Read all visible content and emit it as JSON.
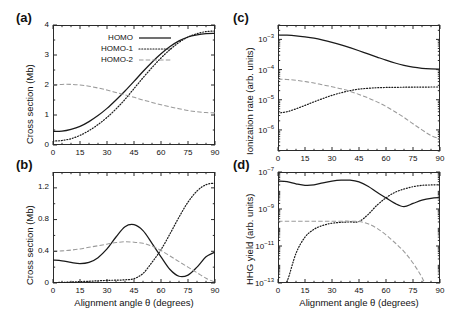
{
  "figure": {
    "shared_xlabel": "Alignment angle θ (degrees)",
    "legend": [
      {
        "label": "HOMO",
        "style": "solid",
        "color": "#1a1a1a"
      },
      {
        "label": "HOMO-1",
        "style": "dotted",
        "color": "#1a1a1a"
      },
      {
        "label": "HOMO-2",
        "style": "dashed",
        "color": "#9a9a9a"
      }
    ],
    "panels": [
      {
        "tag": "(a)"
      },
      {
        "tag": "(b)"
      },
      {
        "tag": "(c)"
      },
      {
        "tag": "(d)"
      }
    ]
  },
  "chart_data": [
    {
      "type": "line",
      "panel": "(a)",
      "title": "",
      "xlabel": "Alignment angle θ (degrees)",
      "ylabel": "Cross section (Mb)",
      "xlim": [
        0,
        90
      ],
      "ylim": [
        0,
        4
      ],
      "xticks": [
        0,
        15,
        30,
        45,
        60,
        75,
        90
      ],
      "yticks": [
        0,
        1,
        2,
        3,
        4
      ],
      "yscale": "linear",
      "grid": false,
      "legend_position": "upper-left-inside",
      "x": [
        0,
        5,
        10,
        15,
        20,
        25,
        30,
        35,
        40,
        45,
        50,
        55,
        60,
        65,
        70,
        75,
        80,
        85,
        90
      ],
      "series": [
        {
          "name": "HOMO",
          "style": "solid",
          "color": "#1a1a1a",
          "values": [
            0.45,
            0.46,
            0.52,
            0.62,
            0.78,
            0.98,
            1.22,
            1.5,
            1.8,
            2.12,
            2.45,
            2.76,
            3.04,
            3.28,
            3.47,
            3.6,
            3.67,
            3.71,
            3.72
          ]
        },
        {
          "name": "HOMO-1",
          "style": "dotted",
          "color": "#1a1a1a",
          "values": [
            0.13,
            0.15,
            0.21,
            0.32,
            0.48,
            0.68,
            0.92,
            1.2,
            1.52,
            1.88,
            2.24,
            2.58,
            2.9,
            3.18,
            3.42,
            3.6,
            3.71,
            3.78,
            3.8
          ]
        },
        {
          "name": "HOMO-2",
          "style": "dashed",
          "color": "#9a9a9a",
          "values": [
            2.0,
            2.02,
            2.02,
            2.0,
            1.96,
            1.9,
            1.83,
            1.75,
            1.67,
            1.59,
            1.5,
            1.42,
            1.34,
            1.27,
            1.21,
            1.15,
            1.11,
            1.08,
            1.07
          ]
        }
      ]
    },
    {
      "type": "line",
      "panel": "(b)",
      "title": "",
      "xlabel": "Alignment angle θ (degrees)",
      "ylabel": "Cross section (Mb)",
      "xlim": [
        0,
        90
      ],
      "ylim": [
        0,
        1.4
      ],
      "xticks": [
        0,
        15,
        30,
        45,
        60,
        75,
        90
      ],
      "yticks": [
        0,
        0.4,
        0.8,
        1.2
      ],
      "yscale": "linear",
      "grid": false,
      "x": [
        0,
        5,
        10,
        15,
        20,
        25,
        30,
        35,
        40,
        45,
        50,
        55,
        60,
        65,
        70,
        75,
        80,
        85,
        90
      ],
      "series": [
        {
          "name": "HOMO",
          "style": "solid",
          "color": "#1a1a1a",
          "values": [
            0.29,
            0.28,
            0.26,
            0.245,
            0.26,
            0.32,
            0.43,
            0.58,
            0.71,
            0.735,
            0.66,
            0.5,
            0.33,
            0.17,
            0.085,
            0.1,
            0.2,
            0.33,
            0.39
          ]
        },
        {
          "name": "HOMO-1",
          "style": "dotted",
          "color": "#1a1a1a",
          "values": [
            0.005,
            0.008,
            0.012,
            0.018,
            0.022,
            0.028,
            0.033,
            0.036,
            0.04,
            0.055,
            0.12,
            0.26,
            0.42,
            0.62,
            0.83,
            1.02,
            1.16,
            1.24,
            1.26
          ]
        },
        {
          "name": "HOMO-2",
          "style": "dashed",
          "color": "#9a9a9a",
          "values": [
            0.4,
            0.405,
            0.415,
            0.43,
            0.45,
            0.47,
            0.49,
            0.51,
            0.52,
            0.515,
            0.5,
            0.465,
            0.41,
            0.34,
            0.27,
            0.2,
            0.13,
            0.06,
            0.01
          ]
        }
      ]
    },
    {
      "type": "line",
      "panel": "(c)",
      "title": "",
      "xlabel": "Alignment angle θ (degrees)",
      "ylabel": "Ionization rate (arb. units)",
      "xlim": [
        0,
        90
      ],
      "ylim": [
        2e-07,
        0.003
      ],
      "xticks": [
        0,
        15,
        30,
        45,
        60,
        75,
        90
      ],
      "yticks": [
        0.001,
        0.0001,
        1e-05,
        1e-06
      ],
      "ytick_labels": [
        "10^-3",
        "10^-4",
        "10^-5",
        "10^-6"
      ],
      "yscale": "log",
      "grid": false,
      "x": [
        0,
        5,
        10,
        15,
        20,
        25,
        30,
        35,
        40,
        45,
        50,
        55,
        60,
        65,
        70,
        75,
        80,
        85,
        90
      ],
      "series": [
        {
          "name": "HOMO",
          "style": "solid",
          "color": "#1a1a1a",
          "values": [
            0.0014,
            0.00138,
            0.00132,
            0.00122,
            0.0011,
            0.00095,
            0.0008,
            0.00066,
            0.00053,
            0.00042,
            0.00033,
            0.00026,
            0.000205,
            0.000165,
            0.000138,
            0.00012,
            0.00011,
            0.000105,
            0.000103
          ]
        },
        {
          "name": "HOMO-1",
          "style": "dotted",
          "color": "#1a1a1a",
          "values": [
            3.6e-06,
            4e-06,
            5e-06,
            6.5e-06,
            8.5e-06,
            1.1e-05,
            1.4e-05,
            1.7e-05,
            2e-05,
            2.25e-05,
            2.4e-05,
            2.5e-05,
            2.55e-05,
            2.58e-05,
            2.6e-05,
            2.62e-05,
            2.63e-05,
            2.64e-05,
            2.65e-05
          ]
        },
        {
          "name": "HOMO-2",
          "style": "dashed",
          "color": "#9a9a9a",
          "values": [
            4.8e-05,
            4.7e-05,
            4.4e-05,
            4e-05,
            3.6e-05,
            3.1e-05,
            2.7e-05,
            2.3e-05,
            1.9e-05,
            1.5e-05,
            1.15e-05,
            8.5e-06,
            6e-06,
            4e-06,
            2.6e-06,
            1.6e-06,
            1e-06,
            6.5e-07,
            5e-07
          ]
        }
      ]
    },
    {
      "type": "line",
      "panel": "(d)",
      "title": "",
      "xlabel": "Alignment angle θ (degrees)",
      "ylabel": "HHG yield (arb. units)",
      "xlim": [
        0,
        90
      ],
      "ylim": [
        1e-13,
        1e-07
      ],
      "xticks": [
        0,
        15,
        30,
        45,
        60,
        75,
        90
      ],
      "yticks": [
        1e-07,
        1e-09,
        1e-11,
        1e-13
      ],
      "ytick_labels": [
        "10^-7",
        "10^-9",
        "10^-11",
        "10^-13"
      ],
      "yscale": "log",
      "grid": false,
      "x": [
        0,
        5,
        10,
        15,
        20,
        25,
        30,
        35,
        40,
        45,
        50,
        55,
        60,
        65,
        70,
        75,
        80,
        85,
        90
      ],
      "series": [
        {
          "name": "HOMO",
          "style": "solid",
          "color": "#1a1a1a",
          "values": [
            3.2e-08,
            3e-08,
            2.3e-08,
            1.9e-08,
            2e-08,
            2.6e-08,
            3.2e-08,
            3.6e-08,
            3.6e-08,
            2.9e-08,
            1.7e-08,
            8e-09,
            4e-09,
            2e-09,
            1.35e-09,
            2e-09,
            3e-09,
            3.8e-09,
            4.2e-09
          ]
        },
        {
          "name": "HOMO-1",
          "style": "dotted",
          "color": "#1a1a1a",
          "values": [
            1e-14,
            1.2e-13,
            4e-12,
            3e-11,
            8e-11,
            1.3e-10,
            1.7e-10,
            1.9e-10,
            2e-10,
            2.1e-10,
            5e-10,
            1.6e-09,
            4e-09,
            8e-09,
            1.2e-08,
            1.6e-08,
            1.9e-08,
            2e-08,
            2.05e-08
          ]
        },
        {
          "name": "HOMO-2",
          "style": "dashed",
          "color": "#9a9a9a",
          "values": [
            2.2e-10,
            2.2e-10,
            2.2e-10,
            2.2e-10,
            2.2e-10,
            2.2e-10,
            2.2e-10,
            2.2e-10,
            2.2e-10,
            2.1e-10,
            1.6e-10,
            9e-11,
            4e-11,
            1.5e-11,
            5e-12,
            1.2e-12,
            2e-13,
            1.2e-14,
            1e-15
          ]
        }
      ]
    }
  ]
}
